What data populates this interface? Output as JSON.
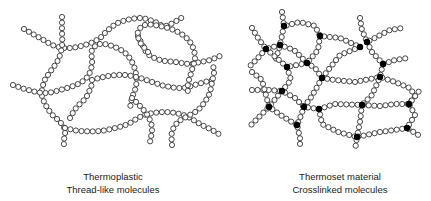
{
  "panels": [
    {
      "id": "thermoplastic",
      "title": "Thermoplastic",
      "subtitle": "Thread-like molecules",
      "crosslinks": false
    },
    {
      "id": "thermoset",
      "title": "Thermoset material",
      "subtitle": "Crosslinked molecules",
      "crosslinks": true
    }
  ],
  "colors": {
    "bead_stroke": "#333333",
    "bead_fill": "#ffffff",
    "crosslink_fill": "#000000"
  }
}
